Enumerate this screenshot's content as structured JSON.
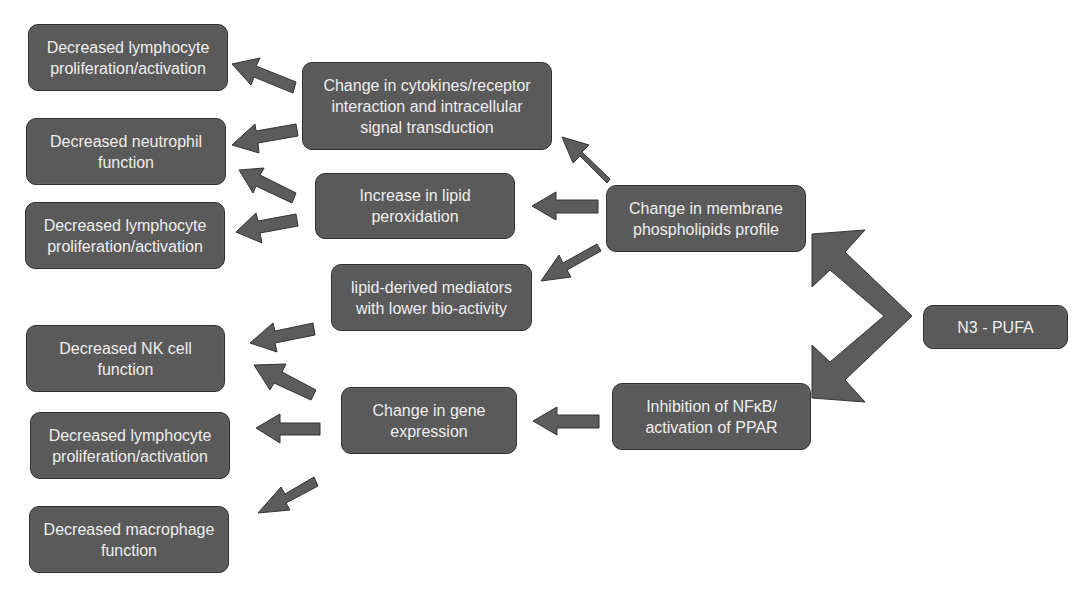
{
  "diagram": {
    "source": {
      "label": "N3 - PUFA"
    },
    "mechanisms": {
      "membrane": "Change in membrane phospholipids profile",
      "nfkb": "Inhibition of NFκB/ activation of PPAR"
    },
    "intermediates": {
      "cytokines": "Change in cytokines/receptor interaction and intracellular signal transduction",
      "lipid_peroxidation": "Increase in lipid peroxidation",
      "lipid_mediators": "lipid-derived mediators with lower bio-activity",
      "gene_expression": "Change in gene expression"
    },
    "outcomes": [
      {
        "label": "Decreased lymphocyte proliferation/activation"
      },
      {
        "label": "Decreased neutrophil function"
      },
      {
        "label": "Decreased lymphocyte proliferation/activation"
      },
      {
        "label": "Decreased NK cell function"
      },
      {
        "label": "Decreased lymphocyte proliferation/activation"
      },
      {
        "label": "Decreased macrophage function"
      }
    ],
    "edges": [
      {
        "from": "N3 - PUFA",
        "to": "Change in membrane phospholipids profile"
      },
      {
        "from": "N3 - PUFA",
        "to": "Inhibition of NFκB/ activation of PPAR"
      },
      {
        "from": "Change in membrane phospholipids profile",
        "to": "Change in cytokines/receptor interaction and intracellular signal transduction"
      },
      {
        "from": "Change in membrane phospholipids profile",
        "to": "Increase in lipid peroxidation"
      },
      {
        "from": "Change in membrane phospholipids profile",
        "to": "lipid-derived mediators with lower bio-activity"
      },
      {
        "from": "Inhibition of NFκB/ activation of PPAR",
        "to": "Change in gene expression"
      },
      {
        "from": "Change in cytokines/receptor interaction and intracellular signal transduction",
        "to": "Decreased lymphocyte proliferation/activation"
      },
      {
        "from": "Change in cytokines/receptor interaction and intracellular signal transduction",
        "to": "Decreased neutrophil function"
      },
      {
        "from": "Increase in lipid peroxidation",
        "to": "Decreased neutrophil function"
      },
      {
        "from": "Increase in lipid peroxidation",
        "to": "Decreased lymphocyte proliferation/activation"
      },
      {
        "from": "lipid-derived mediators with lower bio-activity",
        "to": "Decreased NK cell function"
      },
      {
        "from": "Change in gene expression",
        "to": "Decreased NK cell function"
      },
      {
        "from": "Change in gene expression",
        "to": "Decreased lymphocyte proliferation/activation"
      },
      {
        "from": "Change in gene expression",
        "to": "Decreased macrophage function"
      }
    ],
    "colors": {
      "box_fill": "#5a5a5a",
      "box_border": "#2e2e2e",
      "text": "#eeeeee",
      "arrow": "#5c5c5c"
    }
  }
}
